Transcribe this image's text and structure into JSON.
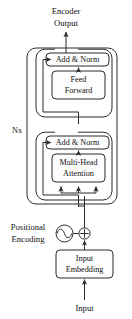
{
  "diagram": {
    "width": 132,
    "height": 319,
    "background": "#ffffff",
    "stroke_color": "#2b2b2b",
    "text_color": "#111111",
    "box_fill": "#fdfdfd"
  },
  "labels": {
    "encoder_output_line1": "Encoder",
    "encoder_output_line2": "Output",
    "add_norm_top": "Add & Norm",
    "feed_forward_line1": "Feed",
    "feed_forward_line2": "Forward",
    "add_norm_bottom": "Add & Norm",
    "multi_head_line1": "Multi-Head",
    "multi_head_line2": "Attention",
    "repeat_count": "Nx",
    "positional_encoding_line1": "Positional",
    "positional_encoding_line2": "Encoding",
    "input_embedding_line1": "Input",
    "input_embedding_line2": "Embedding",
    "input": "Input"
  },
  "icons": {
    "sine_wave_icon": "sine-wave-icon",
    "plus_circle_icon": "plus-circle-icon",
    "arrow_up_icon": "arrow-up-icon"
  },
  "nodes": [
    {
      "name": "add-norm-top",
      "label": "Add & Norm",
      "x": 46,
      "y": 53,
      "w": 63,
      "h": 13
    },
    {
      "name": "feed-forward",
      "label": "Feed Forward",
      "x": 52,
      "y": 71,
      "w": 53,
      "h": 28
    },
    {
      "name": "add-norm-bottom",
      "label": "Add & Norm",
      "x": 46,
      "y": 136,
      "w": 63,
      "h": 13
    },
    {
      "name": "multi-head-attention",
      "label": "Multi-Head Attention",
      "x": 52,
      "y": 154,
      "w": 53,
      "h": 28
    },
    {
      "name": "input-embedding",
      "label": "Input Embedding",
      "x": 53,
      "y": 250,
      "w": 56,
      "h": 28
    }
  ],
  "groups": [
    {
      "name": "encoder-stack",
      "x": 27,
      "y": 48,
      "w": 90,
      "h": 156
    },
    {
      "name": "feed-forward-sublayer",
      "x": 36,
      "y": 49,
      "w": 76,
      "h": 68
    },
    {
      "name": "attention-sublayer",
      "x": 36,
      "y": 132,
      "w": 76,
      "h": 68
    }
  ],
  "connections": [
    {
      "name": "output-arrow",
      "from": "add-norm-top",
      "to": "encoder-output"
    },
    {
      "name": "feed-forward-to-add-norm",
      "from": "feed-forward",
      "to": "add-norm-top"
    },
    {
      "name": "residual-feed-forward",
      "from": "attention-output",
      "to": "add-norm-top"
    },
    {
      "name": "attention-to-add-norm",
      "from": "multi-head-attention",
      "to": "add-norm-bottom"
    },
    {
      "name": "residual-attention",
      "from": "embedding-sum",
      "to": "add-norm-bottom"
    },
    {
      "name": "qkv-fanout",
      "from": "embedding-sum",
      "to": "multi-head-attention"
    },
    {
      "name": "positional-to-sum",
      "from": "positional-encoding",
      "to": "embedding-sum"
    },
    {
      "name": "embedding-to-sum",
      "from": "input-embedding",
      "to": "embedding-sum"
    },
    {
      "name": "input-arrow",
      "from": "input",
      "to": "input-embedding"
    }
  ]
}
